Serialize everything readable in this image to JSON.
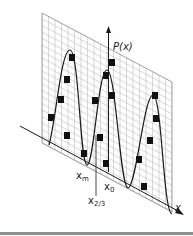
{
  "figure": {
    "y_axis_label": "P(x)",
    "x_axis_label": "x",
    "markers": {
      "x_m": {
        "base": "x",
        "sub": "m"
      },
      "x_0": {
        "base": "x",
        "sub": "0"
      },
      "x_2_3": {
        "base": "x",
        "sub": "2/3"
      }
    },
    "colors": {
      "grid": "#b8b8b8",
      "curve": "#1a1a1a",
      "squares": "#111111",
      "separator": "#8b9097"
    }
  }
}
